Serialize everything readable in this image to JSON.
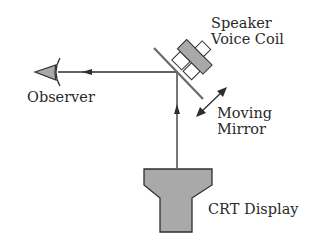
{
  "labels": {
    "speaker_line1": "Speaker",
    "speaker_line2": "Voice Coil",
    "observer": "Observer",
    "mirror_line1": "Moving",
    "mirror_line2": "Mirror",
    "crt": "CRT Display"
  },
  "colors": {
    "fill": "#a9a9a9",
    "stroke": "#2e2e2e",
    "mirror": "#6a6a6a"
  }
}
